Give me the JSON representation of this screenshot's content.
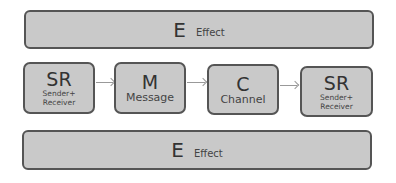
{
  "top_bar": {
    "letter": "E",
    "label": "Effect"
  },
  "bottom_bar": {
    "letter": "E",
    "label": "Effect"
  },
  "boxes": [
    {
      "letter": "SR",
      "label": "Sender+ Receiver"
    },
    {
      "letter": "M",
      "label": "Message"
    },
    {
      "letter": "C",
      "label": "Channel"
    },
    {
      "letter": "SR",
      "label": "Sender+ Receiver"
    }
  ],
  "colors": {
    "fill": "#c9c9c9",
    "border": "#555555",
    "arrow": "#999999"
  }
}
